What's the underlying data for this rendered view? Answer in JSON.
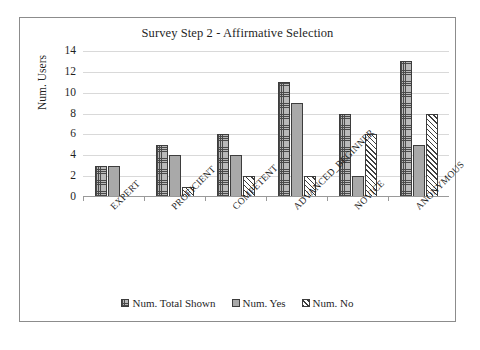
{
  "chart_data": {
    "type": "bar",
    "title": "Survey Step 2 - Affirmative Selection",
    "xlabel": "",
    "ylabel": "Num. Users",
    "ylim": [
      0,
      14
    ],
    "ytick_step": 2,
    "yticks": [
      14,
      12,
      10,
      8,
      6,
      4,
      2,
      0
    ],
    "grid": true,
    "legend_position": "bottom",
    "categories": [
      "EXPERT",
      "PROFICIENT",
      "COMPETENT",
      "ADVANCED_BEGINNER",
      "NOVICE",
      "ANONYMOUS"
    ],
    "series": [
      {
        "name": "Num. Total Shown",
        "pattern": "cross-hatch",
        "values": [
          3,
          5,
          6,
          11,
          8,
          13
        ]
      },
      {
        "name": "Num. Yes",
        "pattern": "solid-gray",
        "values": [
          3,
          4,
          4,
          9,
          2,
          5
        ]
      },
      {
        "name": "Num. No",
        "pattern": "diagonal-hatch",
        "values": [
          0,
          1,
          2,
          2,
          6,
          8
        ]
      }
    ]
  },
  "figure": {
    "caption": ""
  }
}
